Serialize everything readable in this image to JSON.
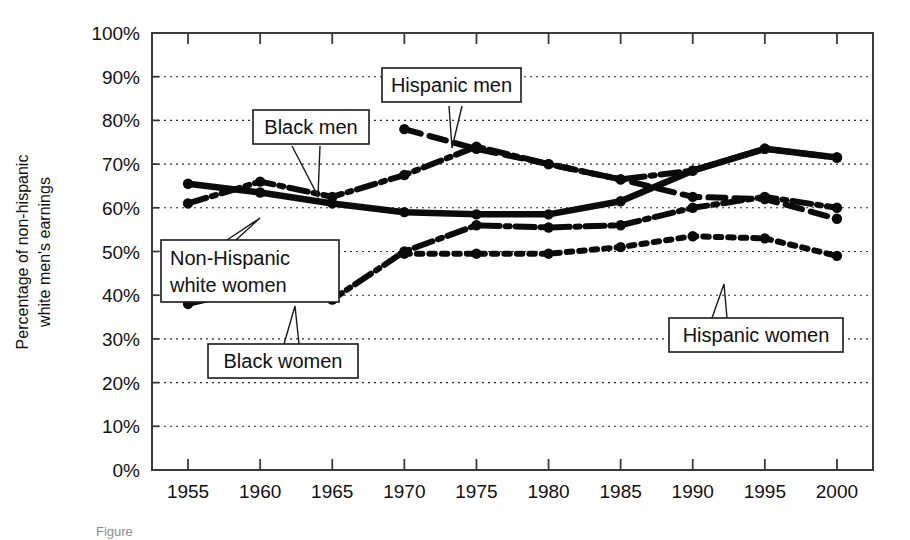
{
  "chart_data": {
    "type": "line",
    "title": "",
    "xlabel": "",
    "ylabel": "Percentage of non-hispanic white men's earnings",
    "x": [
      1955,
      1960,
      1965,
      1970,
      1975,
      1980,
      1985,
      1990,
      1995,
      2000
    ],
    "xtick_labels": [
      "1955",
      "1960",
      "1965",
      "1970",
      "1975",
      "1980",
      "1985",
      "1990",
      "1995",
      "2000"
    ],
    "ytick_labels": [
      "0%",
      "10%",
      "20%",
      "30%",
      "40%",
      "50%",
      "60%",
      "70%",
      "80%",
      "90%",
      "100%"
    ],
    "ytick_values": [
      0,
      10,
      20,
      30,
      40,
      50,
      60,
      70,
      80,
      90,
      100
    ],
    "xlim": [
      1952.5,
      2002.5
    ],
    "ylim": [
      0,
      100
    ],
    "grid": true,
    "legend_position": "inline-callouts",
    "series": [
      {
        "name": "Non-Hispanic white women",
        "style": "solid",
        "x": [
          1955,
          1960,
          1965,
          1970,
          1975,
          1980,
          1985,
          1990,
          1995,
          2000
        ],
        "values": [
          65.5,
          63.5,
          61.0,
          59.0,
          58.5,
          58.5,
          61.5,
          68.5,
          73.5,
          71.5
        ]
      },
      {
        "name": "Black men",
        "style": "dash-dot",
        "x": [
          1955,
          1960,
          1965,
          1970,
          1975,
          1980,
          1985,
          1990,
          1995,
          2000
        ],
        "values": [
          61.0,
          66.0,
          62.5,
          67.5,
          74.0,
          70.0,
          66.5,
          68.5,
          73.5,
          71.5
        ]
      },
      {
        "name": "Hispanic men",
        "style": "dashed",
        "x": [
          1970,
          1975,
          1980,
          1985,
          1990,
          1995,
          2000
        ],
        "values": [
          78.0,
          73.5,
          70.0,
          66.5,
          62.5,
          62.0,
          57.5
        ]
      },
      {
        "name": "Black women",
        "style": "dash-dot",
        "x": [
          1955,
          1960,
          1965,
          1970,
          1975,
          1980,
          1985,
          1990,
          1995,
          2000
        ],
        "values": [
          38.0,
          42.0,
          39.0,
          50.0,
          56.0,
          55.5,
          56.0,
          60.0,
          62.5,
          60.0
        ]
      },
      {
        "name": "Hispanic women",
        "style": "dotted",
        "x": [
          1970,
          1975,
          1980,
          1985,
          1990,
          1995,
          2000
        ],
        "values": [
          49.5,
          49.5,
          49.5,
          51.0,
          53.5,
          53.0,
          49.0
        ]
      }
    ],
    "annotations": [
      {
        "label": "Hispanic men",
        "target_series": "Hispanic men"
      },
      {
        "label": "Black men",
        "target_series": "Black men"
      },
      {
        "label": "Non-Hispanic white women",
        "target_series": "Non-Hispanic white women"
      },
      {
        "label": "Black women",
        "target_series": "Black women"
      },
      {
        "label": "Hispanic women",
        "target_series": "Hispanic women"
      }
    ]
  },
  "axis": {
    "y_title": "Percentage of non-hispanic white men's earnings",
    "y_title_line1": "Percentage of non-hispanic",
    "y_title_line2": "white men's earnings"
  },
  "callouts": {
    "hispanic_men": "Hispanic men",
    "black_men": "Black men",
    "non_hispanic_white_women_line1": "Non-Hispanic",
    "non_hispanic_white_women_line2": "white women",
    "black_women": "Black women",
    "hispanic_women": "Hispanic women"
  },
  "caption": {
    "text": "Figure"
  },
  "colors": {
    "ink": "#0b0b0b",
    "frame": "#3a3a3a",
    "grid": "#2a2a2a",
    "background": "#ffffff",
    "caption": "#8d8d8d"
  }
}
